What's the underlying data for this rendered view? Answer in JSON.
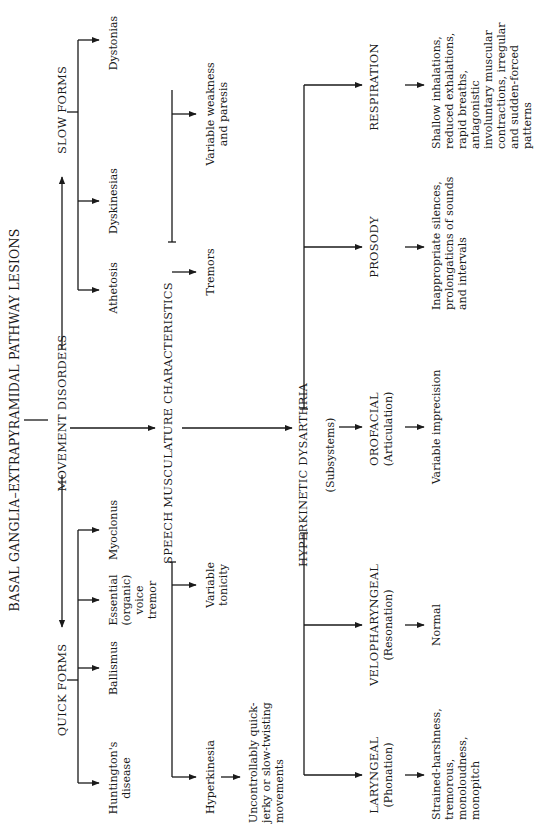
{
  "title": "BASAL GANGLIA–EXTRAPYRAMIDAL PATHWAY LESIONS",
  "movement_disorders": {
    "label": "MOVEMENT DISORDERS",
    "quick_forms": {
      "label": "QUICK FORMS",
      "items": [
        {
          "lines": [
            "Huntington's",
            "disease"
          ]
        },
        {
          "lines": [
            "Ballismus"
          ]
        },
        {
          "lines": [
            "Essential",
            "(organic)",
            "voice",
            "tremor"
          ]
        },
        {
          "lines": [
            "Myoclonus"
          ]
        }
      ]
    },
    "slow_forms": {
      "label": "SLOW FORMS",
      "items": [
        {
          "lines": [
            "Athetosis"
          ]
        },
        {
          "lines": [
            "Dyskinesias"
          ]
        },
        {
          "lines": [
            "Dystonias"
          ]
        }
      ]
    }
  },
  "speech_musculature": {
    "label": "SPEECH MUSCULATURE CHARACTERISTICS",
    "items": [
      {
        "lines": [
          "Hyperkinesia"
        ]
      },
      {
        "lines": [
          "Variable",
          "tonicity"
        ]
      },
      {
        "lines": [
          "Tremors"
        ]
      },
      {
        "lines": [
          "Variable weakness",
          "and paresis"
        ]
      }
    ],
    "hyperkinesia_detail": {
      "lines": [
        "Uncontrollably quick-",
        "jerky or slow-twisting",
        "movements"
      ]
    }
  },
  "hyperkinetic_dysarthria": {
    "label": "HYPERKINETIC DYSARTHRIA",
    "subsystems_label": "(Subsystems)",
    "subsystems": [
      {
        "name": "LARYNGEAL",
        "sub": "(Phonation)",
        "detail": [
          "Strained-harshness,",
          "tremorous,",
          "monoloudness,",
          "monopitch"
        ]
      },
      {
        "name": "VELOPHARYNGEAL",
        "sub": "(Resonation)",
        "detail": [
          "Normal"
        ]
      },
      {
        "name": "OROFACIAL",
        "sub": "(Articulation)",
        "detail": [
          "Variable imprecision"
        ]
      },
      {
        "name": "PROSODY",
        "sub": "",
        "detail": [
          "Inappropriate silences,",
          "prolongaticns of sounds",
          "and intervals"
        ]
      },
      {
        "name": "RESPIRATION",
        "sub": "",
        "detail": [
          "Shallow inhalations,",
          "reduced exhalations,",
          "rapid breaths,",
          "antagonistic",
          "involuntary muscular",
          "contractions, irregular",
          "and sudden-forced",
          "patterns"
        ]
      }
    ]
  }
}
